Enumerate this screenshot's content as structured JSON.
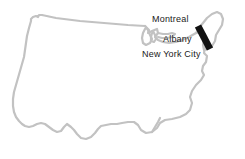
{
  "figure": {
    "type": "outline-map",
    "region": "Contiguous United States",
    "background_color": "#ffffff",
    "outline_color": "#c2c2c2",
    "outline_width_px": 2.2,
    "label_color": "#1a1a1a",
    "marker_color": "#111111"
  },
  "labels": {
    "montreal": "Montreal",
    "albany": "Albany",
    "new_york_city": "New York City"
  },
  "markers": [
    {
      "name": "northeast-corridor-bar",
      "shape": "thick-diagonal-bar",
      "color": "#111111",
      "x1": 198,
      "y1": 26,
      "x2": 210,
      "y2": 49,
      "thickness_px": 7
    }
  ],
  "chart_data": {
    "type": "map",
    "title": "",
    "xlabel": "",
    "ylabel": "",
    "annotations": [
      {
        "label": "Montreal",
        "x": 152,
        "y": 14
      },
      {
        "label": "Albany",
        "x": 163,
        "y": 34
      },
      {
        "label": "New York City",
        "x": 142,
        "y": 49
      }
    ],
    "series": [
      {
        "name": "northeast-corridor-bar",
        "values": [
          [
            198,
            26
          ],
          [
            210,
            49
          ]
        ]
      }
    ]
  }
}
